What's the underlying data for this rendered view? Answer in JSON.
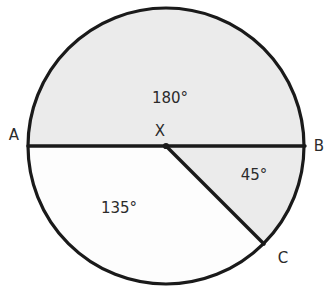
{
  "figure": {
    "background_color": "#ffffff",
    "stroke_color": "#1a1a1a",
    "shaded_fill": "#ebebeb",
    "unshaded_fill": "#fdfdfd",
    "text_color": "#2b2b2b",
    "circle": {
      "center_x": 166,
      "center_y": 146,
      "radius": 138,
      "stroke_width": 3.2
    },
    "points": [
      {
        "id": "A",
        "label": "A",
        "x": 28,
        "y": 146,
        "label_x": 14,
        "label_y": 135
      },
      {
        "id": "B",
        "label": "B",
        "x": 305,
        "y": 146,
        "label_x": 319,
        "label_y": 146
      },
      {
        "id": "X",
        "label": "X",
        "x": 166,
        "y": 146,
        "label_x": 160,
        "label_y": 131
      },
      {
        "id": "C",
        "label": "C",
        "x": 264,
        "y": 244,
        "label_x": 283,
        "label_y": 258
      }
    ],
    "segments": [
      {
        "id": "diameter-ab",
        "from": "A",
        "to": "B",
        "x1": 28,
        "y1": 146,
        "x2": 305,
        "y2": 146,
        "width": 3.4
      },
      {
        "id": "radius-xc",
        "from": "X",
        "to": "C",
        "x1": 166,
        "y1": 146,
        "x2": 264,
        "y2": 244,
        "width": 3.4
      }
    ],
    "sectors": [
      {
        "id": "sector-upper",
        "label": "180°",
        "value": 180,
        "shaded": true,
        "fill": "#ebebeb",
        "label_x": 170,
        "label_y": 98,
        "path": "M 166 146 L 28 146 A 138 138 0 0 1 304 146 Z"
      },
      {
        "id": "sector-bxc",
        "label": "45°",
        "value": 45,
        "shaded": true,
        "fill": "#ebebeb",
        "label_x": 254,
        "label_y": 175,
        "path": "M 166 146 L 304 146 A 138 138 0 0 1 263.58 243.58 Z"
      },
      {
        "id": "sector-cxa",
        "label": "135°",
        "value": 135,
        "shaded": false,
        "fill": "#fdfdfd",
        "label_x": 119,
        "label_y": 208,
        "path": "M 166 146 L 263.58 243.58 A 138 138 0 0 1 28 146 Z"
      }
    ]
  }
}
